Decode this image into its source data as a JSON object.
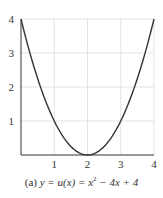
{
  "chart_data": {
    "type": "line",
    "title": "",
    "caption": "(a) y = u(x) = x^2 − 4x + 4",
    "caption_parts": {
      "label": "(a)",
      "lhs": "y = u(x) = x",
      "exp": "2",
      "rhs": " − 4x + 4"
    },
    "xlabel": "",
    "ylabel": "",
    "xlim": [
      0,
      4
    ],
    "ylim": [
      0,
      4
    ],
    "xticks": [
      1,
      2,
      3,
      4
    ],
    "yticks": [
      1,
      2,
      3,
      4
    ],
    "grid": true,
    "series": [
      {
        "name": "u(x) = x^2 - 4x + 4",
        "x": [
          0,
          0.25,
          0.5,
          0.75,
          1,
          1.25,
          1.5,
          1.75,
          2,
          2.25,
          2.5,
          2.75,
          3,
          3.25,
          3.5,
          3.75,
          4
        ],
        "y": [
          4,
          3.0625,
          2.25,
          1.5625,
          1,
          0.5625,
          0.25,
          0.0625,
          0,
          0.0625,
          0.25,
          0.5625,
          1,
          1.5625,
          2.25,
          3.0625,
          4
        ]
      }
    ],
    "colors": {
      "curve": "#333333",
      "axis": "#333333",
      "grid": "#e3e3e3"
    }
  }
}
